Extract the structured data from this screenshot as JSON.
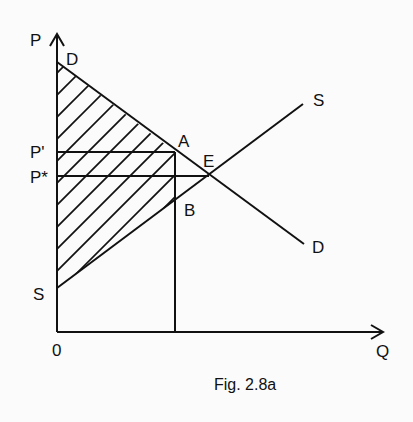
{
  "figure": {
    "caption": "Fig. 2.8a",
    "axes": {
      "y_label": "P",
      "x_label": "Q",
      "origin_label": "0"
    },
    "curves": {
      "demand": {
        "label_start": "D",
        "label_end": "D"
      },
      "supply": {
        "label_start": "S",
        "label_end": "S"
      }
    },
    "price_labels": {
      "p_prime": "P'",
      "p_star": "P*"
    },
    "points": {
      "a": "A",
      "b": "B",
      "e": "E"
    },
    "colors": {
      "line": "#111111",
      "background": "#fbfbfb"
    }
  }
}
